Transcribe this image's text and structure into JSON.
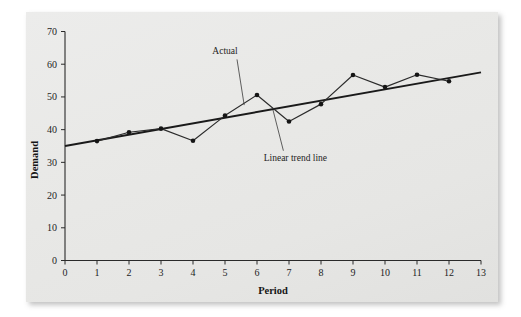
{
  "chart_data": {
    "type": "line",
    "title": "",
    "xlabel": "Period",
    "ylabel": "Demand",
    "xlim": [
      0,
      13
    ],
    "ylim": [
      0,
      70
    ],
    "xticks": [
      0,
      1,
      2,
      3,
      4,
      5,
      6,
      7,
      8,
      9,
      10,
      11,
      12,
      13
    ],
    "yticks": [
      0,
      10,
      20,
      30,
      40,
      50,
      60,
      70
    ],
    "xtick_labels": [
      "0",
      "1",
      "2",
      "3",
      "4",
      "5",
      "6",
      "7",
      "8",
      "9",
      "10",
      "11",
      "12",
      "13"
    ],
    "ytick_labels": [
      "0",
      "10",
      "20",
      "30",
      "40",
      "50",
      "60",
      "70"
    ],
    "grid": false,
    "legend": "none",
    "series": [
      {
        "name": "Actual",
        "kind": "line-with-markers",
        "x": [
          1,
          2,
          3,
          4,
          5,
          6,
          7,
          8,
          9,
          10,
          11,
          12
        ],
        "values": [
          36.5,
          39.2,
          40.3,
          36.6,
          44.3,
          50.6,
          42.5,
          47.8,
          56.7,
          53.0,
          56.8,
          54.8
        ],
        "color": "#2b2b2b"
      },
      {
        "name": "Linear trend line",
        "kind": "line",
        "x": [
          0,
          13
        ],
        "values": [
          35.0,
          57.5
        ],
        "color": "#1a1a1a"
      }
    ],
    "annotations": [
      {
        "label": "Actual",
        "text_x": 5.0,
        "text_y": 63.0,
        "target_x": 5.6,
        "target_y": 47.5
      },
      {
        "label": "Linear trend line",
        "text_x": 7.2,
        "text_y": 30.5,
        "target_x": 6.5,
        "target_y": 46.0
      }
    ]
  },
  "axes": {
    "y_title": "Demand",
    "x_title": "Period"
  }
}
